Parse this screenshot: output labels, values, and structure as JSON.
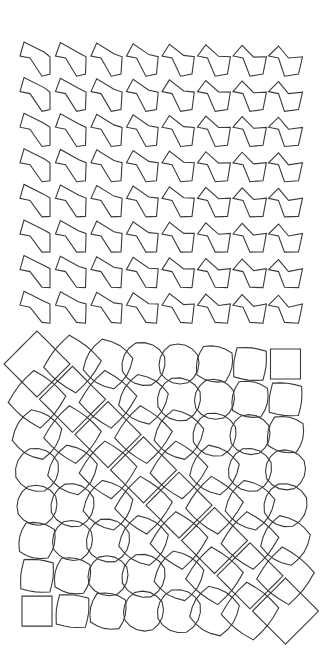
{
  "canvas": {
    "width": 321,
    "height": 653,
    "background": "#ffffff",
    "stroke": "#3a3a3a"
  },
  "top_grid": {
    "rows": 8,
    "cols": 8,
    "origin_x": 38,
    "origin_y": 60,
    "step_x": 35.5,
    "step_y": 35.6,
    "description": "distorted pentagonal flag shapes, skew varying across grid"
  },
  "bottom_grid": {
    "rows": 8,
    "cols": 8,
    "origin_x": 37,
    "origin_y": 38,
    "step_x": 35.5,
    "step_y": 35.3,
    "description": "squares at bottom-left and top-right corners morphing into octagons and large rotated diamonds along anti-diagonal"
  }
}
